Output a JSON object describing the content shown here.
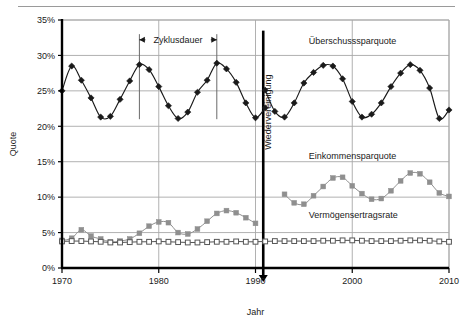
{
  "chart_data": {
    "type": "line",
    "title": "",
    "xlabel": "Jahr",
    "ylabel": "Quote",
    "xlim": [
      1970,
      2010
    ],
    "ylim": [
      0,
      35
    ],
    "grid": true,
    "legend_position": "inline-right",
    "x_ticks": [
      "1970",
      "1980",
      "1990",
      "2000",
      "2010"
    ],
    "x_tick_values": [
      1970,
      1980,
      1990,
      2000,
      2010
    ],
    "y_ticks": [
      "0%",
      "5%",
      "10%",
      "15%",
      "20%",
      "25%",
      "30%",
      "35%"
    ],
    "y_tick_values": [
      0,
      5,
      10,
      15,
      20,
      25,
      30,
      35
    ],
    "series": [
      {
        "name": "Überschusssparquote",
        "color": "#1a1a1a",
        "marker": "filled-diamond",
        "label_x": 1995.5,
        "label_y": 31.6,
        "segments": [
          {
            "x": [
              1970,
              1971,
              1972,
              1973,
              1974,
              1975,
              1976,
              1977,
              1978,
              1979,
              1980,
              1981,
              1982,
              1983,
              1984,
              1985,
              1986,
              1987,
              1988,
              1989,
              1990,
              1991
            ],
            "y": [
              25.0,
              28.5,
              26.5,
              24.0,
              21.3,
              21.4,
              23.8,
              26.4,
              28.7,
              28.0,
              25.6,
              22.9,
              21.1,
              22.0,
              24.8,
              26.5,
              28.9,
              28.1,
              26.2,
              23.3,
              21.2,
              22.6
            ]
          },
          {
            "x": [
              1991,
              1992,
              1993,
              1994,
              1995,
              1996,
              1997,
              1998,
              1999,
              2000,
              2001,
              2002,
              2003,
              2004,
              2005,
              2006,
              2007,
              2008,
              2009,
              2010
            ],
            "y": [
              25.1,
              22.1,
              21.3,
              23.3,
              26.1,
              27.6,
              28.6,
              28.5,
              26.7,
              23.5,
              21.3,
              21.7,
              23.3,
              25.6,
              27.5,
              28.7,
              27.9,
              25.4,
              21.1,
              22.3
            ]
          }
        ]
      },
      {
        "name": "Einkommensparquote",
        "color": "#8f8f8f",
        "marker": "filled-square",
        "label_x": 1995.5,
        "label_y": 15.4,
        "segments": [
          {
            "x": [
              1970,
              1971,
              1972,
              1973,
              1974,
              1975,
              1976,
              1977,
              1978,
              1979,
              1980,
              1981,
              1982,
              1983,
              1984,
              1985,
              1986,
              1987,
              1988,
              1989,
              1990
            ],
            "y": [
              3.9,
              4.2,
              5.4,
              4.5,
              4.1,
              3.7,
              3.8,
              4.1,
              4.9,
              5.9,
              6.5,
              6.4,
              5.0,
              4.8,
              5.5,
              6.6,
              7.7,
              8.1,
              7.8,
              7.1,
              6.3
            ]
          },
          {
            "x": [
              1993,
              1994,
              1995,
              1996,
              1997,
              1998,
              1999,
              2000,
              2001,
              2002,
              2003,
              2004,
              2005,
              2006,
              2007,
              2008,
              2009,
              2010
            ],
            "y": [
              10.4,
              9.2,
              9.0,
              10.2,
              11.5,
              12.7,
              12.8,
              11.6,
              10.5,
              9.7,
              9.8,
              10.9,
              12.3,
              13.4,
              13.3,
              12.1,
              10.6,
              10.1
            ]
          }
        ]
      },
      {
        "name": "Vermögensertragsrate",
        "color": "#555555",
        "marker": "open-square",
        "label_x": 1995.5,
        "label_y": 7.0,
        "segments": [
          {
            "x": [
              1970,
              1971,
              1972,
              1973,
              1974,
              1975,
              1976,
              1977,
              1978,
              1979,
              1980,
              1981,
              1982,
              1983,
              1984,
              1985,
              1986,
              1987,
              1988,
              1989,
              1990,
              1991,
              1992,
              1993,
              1994,
              1995,
              1996,
              1997,
              1998,
              1999,
              2000,
              2001,
              2002,
              2003,
              2004,
              2005,
              2006,
              2007,
              2008,
              2009,
              2010
            ],
            "y": [
              3.75,
              3.8,
              3.8,
              3.75,
              3.7,
              3.6,
              3.6,
              3.65,
              3.7,
              3.7,
              3.75,
              3.7,
              3.65,
              3.6,
              3.6,
              3.65,
              3.7,
              3.7,
              3.75,
              3.7,
              3.7,
              3.75,
              3.8,
              3.8,
              3.8,
              3.8,
              3.8,
              3.85,
              3.85,
              3.9,
              3.9,
              3.85,
              3.8,
              3.8,
              3.8,
              3.85,
              3.9,
              3.9,
              3.85,
              3.75,
              3.7
            ]
          }
        ]
      }
    ],
    "annotations": [
      {
        "name": "zyklusdauer",
        "text": "Zyklusdauer",
        "type": "double-arrow-span",
        "x_start": 1978,
        "x_end": 1986,
        "y_text": 32.2,
        "marker_y_top": 33.0,
        "marker_y_bottom": 21.0
      },
      {
        "name": "wiedervereinigung",
        "text": "Wiedervereinigung",
        "type": "vertical-marker-arrow",
        "x": 1990.8,
        "y_top": 33.5,
        "y_bottom": 0,
        "text_x": 1991.6,
        "text_y": 22.0
      }
    ]
  }
}
